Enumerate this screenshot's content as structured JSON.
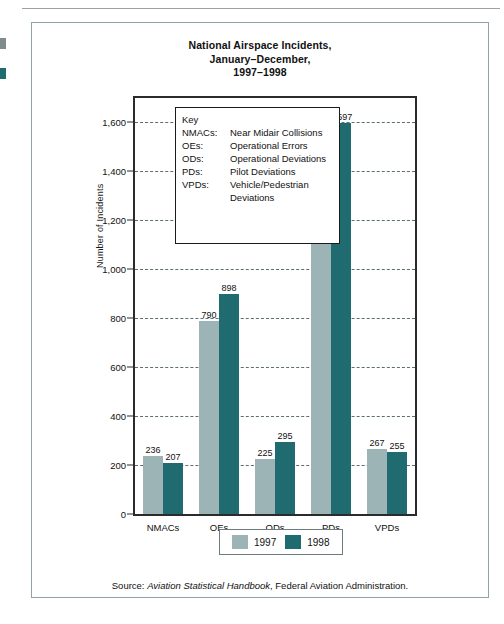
{
  "figure": {
    "title_lines": [
      "National Airspace Incidents,",
      "January–December,",
      "1997–1998"
    ],
    "source_prefix": "Source: ",
    "source_italic": "Aviation Statistical Handbook",
    "source_suffix": ", Federal Aviation Administration."
  },
  "key": {
    "heading": "Key",
    "entries": [
      {
        "abbr": "NMACs:",
        "desc": "Near Midair Collisions"
      },
      {
        "abbr": "OEs:",
        "desc": "Operational Errors"
      },
      {
        "abbr": "ODs:",
        "desc": "Operational Deviations"
      },
      {
        "abbr": "PDs:",
        "desc": "Pilot Deviations"
      },
      {
        "abbr": "VPDs:",
        "desc": "Vehicle/Pedestrian Deviations"
      }
    ]
  },
  "legend": {
    "items": [
      {
        "label": "1997",
        "color": "#9cb4b6"
      },
      {
        "label": "1998",
        "color": "#1f6b70"
      }
    ]
  },
  "chart_data": {
    "type": "bar",
    "title": "National Airspace Incidents, January–December, 1997–1998",
    "xlabel": "",
    "ylabel": "Number of Incidents",
    "ylim": [
      0,
      1700
    ],
    "yticks": [
      0,
      200,
      400,
      600,
      800,
      1000,
      1200,
      1400,
      1600
    ],
    "ytick_labels": [
      "0",
      "200",
      "400",
      "600",
      "800",
      "1,000",
      "1,200",
      "1,400",
      "1,600"
    ],
    "grid": true,
    "grid_axis": "y",
    "legend_position": "bottom",
    "categories": [
      "NMACs",
      "OEs",
      "ODs",
      "PDs",
      "VPDs"
    ],
    "series": [
      {
        "name": "1997",
        "color": "#9cb4b6",
        "values": [
          236,
          790,
          225,
          1496,
          267
        ],
        "value_labels": [
          "236",
          "790",
          "225",
          "1,496",
          "267"
        ]
      },
      {
        "name": "1998",
        "color": "#1f6b70",
        "values": [
          207,
          898,
          295,
          1597,
          255
        ],
        "value_labels": [
          "207",
          "898",
          "295",
          "1,597",
          "255"
        ]
      }
    ]
  }
}
